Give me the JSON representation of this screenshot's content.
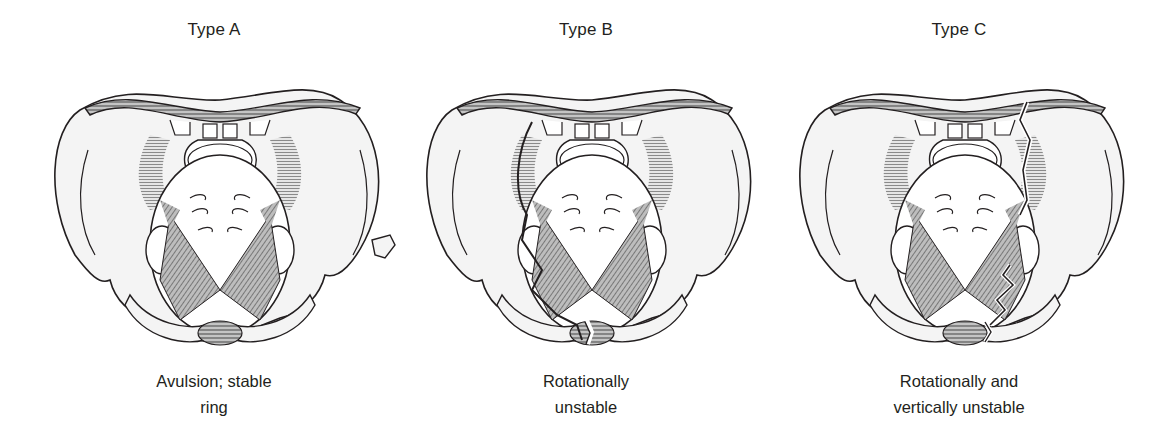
{
  "figure": {
    "panels": [
      {
        "title": "Type A",
        "caption_lines": [
          "Avulsion; stable",
          "ring"
        ],
        "illustration": "pelvis-stable-ring-with-avulsion-fragment"
      },
      {
        "title": "Type B",
        "caption_lines": [
          "Rotationally",
          "unstable"
        ],
        "illustration": "pelvis-rotationally-unstable-fracture"
      },
      {
        "title": "Type C",
        "caption_lines": [
          "Rotationally and",
          "vertically unstable"
        ],
        "illustration": "pelvis-rotationally-and-vertically-unstable-fracture"
      }
    ],
    "colors": {
      "outline": "#231f20",
      "bone_fill": "#f4f4f4",
      "ligament_fill": "#9a9a9a",
      "background": "#ffffff"
    }
  }
}
